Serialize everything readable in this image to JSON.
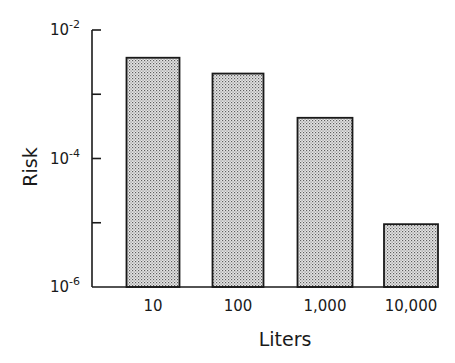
{
  "chart_data": {
    "type": "bar",
    "title": "",
    "xlabel": "Liters",
    "ylabel": "Risk",
    "yscale": "log",
    "ylim": [
      1e-06,
      0.01
    ],
    "grid": false,
    "legend": null,
    "categories": [
      "10",
      "100",
      "1,000",
      "10,000"
    ],
    "values": [
      0.0037,
      0.0021,
      0.00043,
      9.5e-06
    ],
    "y_ticks": [
      {
        "base": "10",
        "exp": "-2",
        "value": 0.01,
        "labeled": true
      },
      {
        "base": "",
        "exp": "",
        "value": 0.001,
        "labeled": false
      },
      {
        "base": "10",
        "exp": "-4",
        "value": 0.0001,
        "labeled": true
      },
      {
        "base": "",
        "exp": "",
        "value": 1e-05,
        "labeled": false
      },
      {
        "base": "10",
        "exp": "-6",
        "value": 1e-06,
        "labeled": true
      }
    ],
    "bar_fill": "stippled gray",
    "colors": {
      "bar_fill": "#d4d4d4",
      "bar_dot": "#6a6a6a",
      "stroke": "#1a1a1a"
    }
  }
}
